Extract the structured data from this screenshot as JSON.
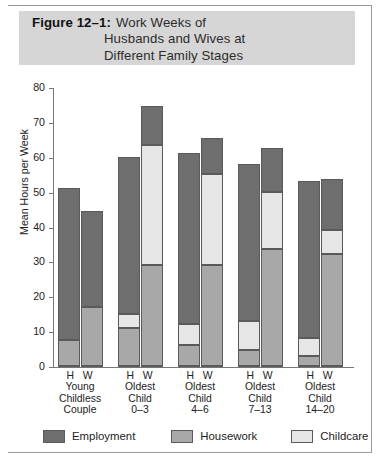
{
  "figure": {
    "number_label": "Figure 12–1:",
    "title_lines": [
      "Work Weeks of",
      "Husbands and Wives at",
      "Different Family Stages"
    ]
  },
  "colors": {
    "employment": "#6e6e6e",
    "housework": "#a8a8a8",
    "childcare": "#e6e6e6",
    "title_band": "#d6d6d6",
    "axis": "#777777"
  },
  "axis": {
    "ylabel": "Mean Hours per Week",
    "yticks": [
      "0",
      "10",
      "20",
      "30",
      "40",
      "50",
      "60",
      "70",
      "80"
    ]
  },
  "legend": {
    "items": [
      {
        "label": "Employment",
        "color_key": "employment"
      },
      {
        "label": "Housework",
        "color_key": "housework"
      },
      {
        "label": "Childcare",
        "color_key": "childcare"
      }
    ]
  },
  "xaxis": {
    "groups": [
      {
        "hw": "H  W",
        "lines": [
          "Young",
          "Childless",
          "Couple"
        ]
      },
      {
        "hw": "H  W",
        "lines": [
          "Oldest",
          "Child",
          "0–3"
        ]
      },
      {
        "hw": "H  W",
        "lines": [
          "Oldest",
          "Child",
          "4–6"
        ]
      },
      {
        "hw": "H  W",
        "lines": [
          "Oldest",
          "Child",
          "7–13"
        ]
      },
      {
        "hw": "H  W",
        "lines": [
          "Oldest",
          "Child",
          "14–20"
        ]
      }
    ]
  },
  "chart_data": {
    "type": "bar",
    "subtype": "stacked-grouped",
    "title": "Figure 12–1: Work Weeks of Husbands and Wives at Different Family Stages",
    "xlabel": "",
    "ylabel": "Mean Hours per Week",
    "ylim": [
      0,
      80
    ],
    "ytick_step": 10,
    "grid": false,
    "legend_position": "bottom",
    "categories": [
      "Young Childless Couple",
      "Oldest Child 0–3",
      "Oldest Child 4–6",
      "Oldest Child 7–13",
      "Oldest Child 14–20"
    ],
    "subgroups": [
      "H",
      "W"
    ],
    "stack_order_bottom_to_top": [
      "Housework",
      "Childcare",
      "Employment"
    ],
    "series": [
      {
        "name": "Housework",
        "color": "#a8a8a8",
        "values": {
          "H": [
            7.5,
            11.0,
            6.0,
            4.5,
            3.0
          ],
          "W": [
            17.0,
            29.0,
            29.0,
            33.5,
            32.0
          ]
        }
      },
      {
        "name": "Childcare",
        "color": "#e6e6e6",
        "values": {
          "H": [
            0.0,
            4.0,
            6.0,
            8.5,
            5.0
          ],
          "W": [
            0.0,
            34.5,
            26.0,
            16.5,
            7.0
          ]
        }
      },
      {
        "name": "Employment",
        "color": "#6e6e6e",
        "values": {
          "H": [
            43.5,
            45.0,
            49.0,
            45.0,
            45.0
          ],
          "W": [
            27.5,
            11.0,
            10.5,
            12.5,
            14.5
          ]
        }
      }
    ],
    "totals": {
      "H": [
        51.0,
        60.0,
        61.0,
        58.0,
        53.0
      ],
      "W": [
        44.5,
        74.5,
        65.5,
        62.5,
        53.5
      ]
    }
  }
}
